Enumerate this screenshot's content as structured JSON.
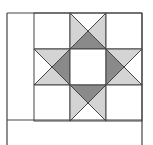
{
  "diagram": {
    "type": "quilt-block",
    "colors": {
      "background": "#ffffff",
      "line": "#444444",
      "light": "#d4d4d4",
      "dark": "#8a8a8a"
    },
    "grid": {
      "origin_x": 34,
      "origin_y": 13,
      "cell_size": 36,
      "rows": 3,
      "cols": 3
    },
    "cells": [
      {
        "row": 0,
        "col": 0,
        "kind": "plain"
      },
      {
        "row": 0,
        "col": 1,
        "kind": "qst",
        "top": "white",
        "right": "light",
        "bottom": "dark",
        "left": "light"
      },
      {
        "row": 0,
        "col": 2,
        "kind": "plain"
      },
      {
        "row": 1,
        "col": 0,
        "kind": "qst",
        "top": "light",
        "right": "dark",
        "bottom": "light",
        "left": "white"
      },
      {
        "row": 1,
        "col": 1,
        "kind": "plain"
      },
      {
        "row": 1,
        "col": 2,
        "kind": "qst",
        "top": "light",
        "right": "white",
        "bottom": "light",
        "left": "dark"
      },
      {
        "row": 2,
        "col": 0,
        "kind": "plain"
      },
      {
        "row": 2,
        "col": 1,
        "kind": "qst",
        "top": "dark",
        "right": "light",
        "bottom": "white",
        "left": "light"
      },
      {
        "row": 2,
        "col": 2,
        "kind": "plain"
      }
    ],
    "borders": {
      "left_x": 7,
      "right_x": 142,
      "top_y": 13,
      "bottom_rule_y": 120,
      "bottom_edge_y": 145
    }
  }
}
